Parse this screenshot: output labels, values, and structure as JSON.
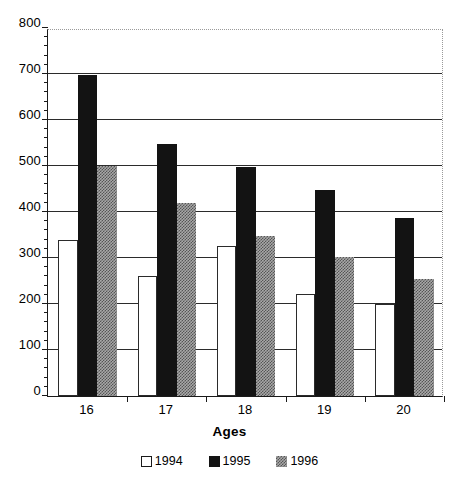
{
  "chart_data": {
    "type": "bar",
    "title": "",
    "xlabel": "Ages",
    "ylabel": "",
    "categories": [
      "16",
      "17",
      "18",
      "19",
      "20"
    ],
    "series": [
      {
        "name": "1994",
        "values": [
          340,
          260,
          326,
          221,
          199
        ],
        "color": "#ffffff",
        "pattern": "open"
      },
      {
        "name": "1995",
        "values": [
          698,
          547,
          497,
          447,
          388
        ],
        "color": "#131313",
        "pattern": "solid"
      },
      {
        "name": "1996",
        "values": [
          500,
          420,
          348,
          302,
          255
        ],
        "color": "#a8a8a8",
        "pattern": "checker"
      }
    ],
    "ylim": [
      0,
      800
    ],
    "ytick_step": 100,
    "ytick_labels": [
      "0",
      "100",
      "200",
      "300",
      "400",
      "500",
      "600",
      "700",
      "800"
    ],
    "yminor_step": 20,
    "grid": true,
    "grid_top_dotted": true,
    "legend_position": "bottom"
  },
  "axis": {
    "x_title": "Ages"
  },
  "legend": {
    "items": [
      {
        "label": "1994",
        "swatch": "legend-swatch-open-white"
      },
      {
        "label": "1995",
        "swatch": "legend-swatch-solid-black"
      },
      {
        "label": "1996",
        "swatch": "legend-swatch-checker-gray"
      }
    ]
  }
}
